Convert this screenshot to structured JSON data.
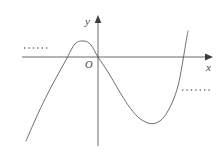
{
  "figure": {
    "kind": "cartesian-plane-cubic-curve",
    "width": 222,
    "height": 154,
    "background_color": "#ffffff"
  },
  "labels": {
    "y_axis": "y",
    "x_axis": "x",
    "origin": "O"
  },
  "colors": {
    "axis": "#5a5a5a",
    "curve": "#555555",
    "dotted": "#6b6b6b",
    "text": "#4a4a4a",
    "background": "#ffffff"
  },
  "chart_data": {
    "type": "line",
    "title": "",
    "xlabel": "x",
    "ylabel": "y",
    "grid": false,
    "legend": null,
    "axes": {
      "origin_px": [
        98,
        57
      ],
      "x_axis_px": {
        "x_start": 22,
        "x_end": 213,
        "y": 57,
        "arrow_end": "right"
      },
      "y_axis_px": {
        "y_start": 16,
        "y_end": 146,
        "x": 98,
        "arrow_end": "top"
      }
    },
    "series": [
      {
        "name": "cubic curve",
        "shape": "cubic",
        "description": "Rises from lower-left, local maximum above x-axis left of origin, passes through origin, local minimum below x-axis right of origin, rises steeply to upper-right",
        "points_px": [
          [
            26,
            141
          ],
          [
            36,
            118
          ],
          [
            46,
            97
          ],
          [
            56,
            78
          ],
          [
            66,
            60
          ],
          [
            75,
            44
          ],
          [
            84,
            41
          ],
          [
            91,
            45
          ],
          [
            98,
            57
          ],
          [
            108,
            72
          ],
          [
            118,
            89
          ],
          [
            128,
            105
          ],
          [
            138,
            117
          ],
          [
            148,
            123
          ],
          [
            156,
            123
          ],
          [
            164,
            117
          ],
          [
            172,
            103
          ],
          [
            178,
            86
          ],
          [
            182,
            66
          ],
          [
            186,
            42
          ],
          [
            188,
            31
          ]
        ],
        "local_maximum_px": [
          79,
          41
        ],
        "local_minimum_px": [
          152,
          124
        ],
        "x_intercepts_px": [
          [
            64,
            57
          ],
          [
            98,
            57
          ],
          [
            178,
            57
          ]
        ]
      }
    ],
    "annotations": [
      {
        "name": "left-dotted-line",
        "type": "dotted-horizontal-segment",
        "x_start_px": 24,
        "x_end_px": 49,
        "y_px": 48,
        "meaning": "horizontal level at local maximum height, left side"
      },
      {
        "name": "right-dotted-line",
        "type": "dotted-horizontal-segment",
        "x_start_px": 182,
        "x_end_px": 211,
        "y_px": 90,
        "meaning": "horizontal level marker, right side"
      }
    ]
  }
}
